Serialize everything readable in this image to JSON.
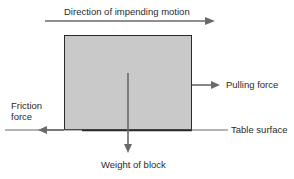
{
  "diagram": {
    "labels": {
      "motion": "Direction of impending motion",
      "pulling": "Pulling force",
      "friction_line1": "Friction",
      "friction_line2": "force",
      "table": "Table surface",
      "weight": "Weight of block"
    },
    "colors": {
      "block_fill": "#c9c9c9",
      "block_stroke": "#2a2a2a",
      "arrow": "#6a6a6a",
      "text": "#2a2a2a"
    }
  }
}
